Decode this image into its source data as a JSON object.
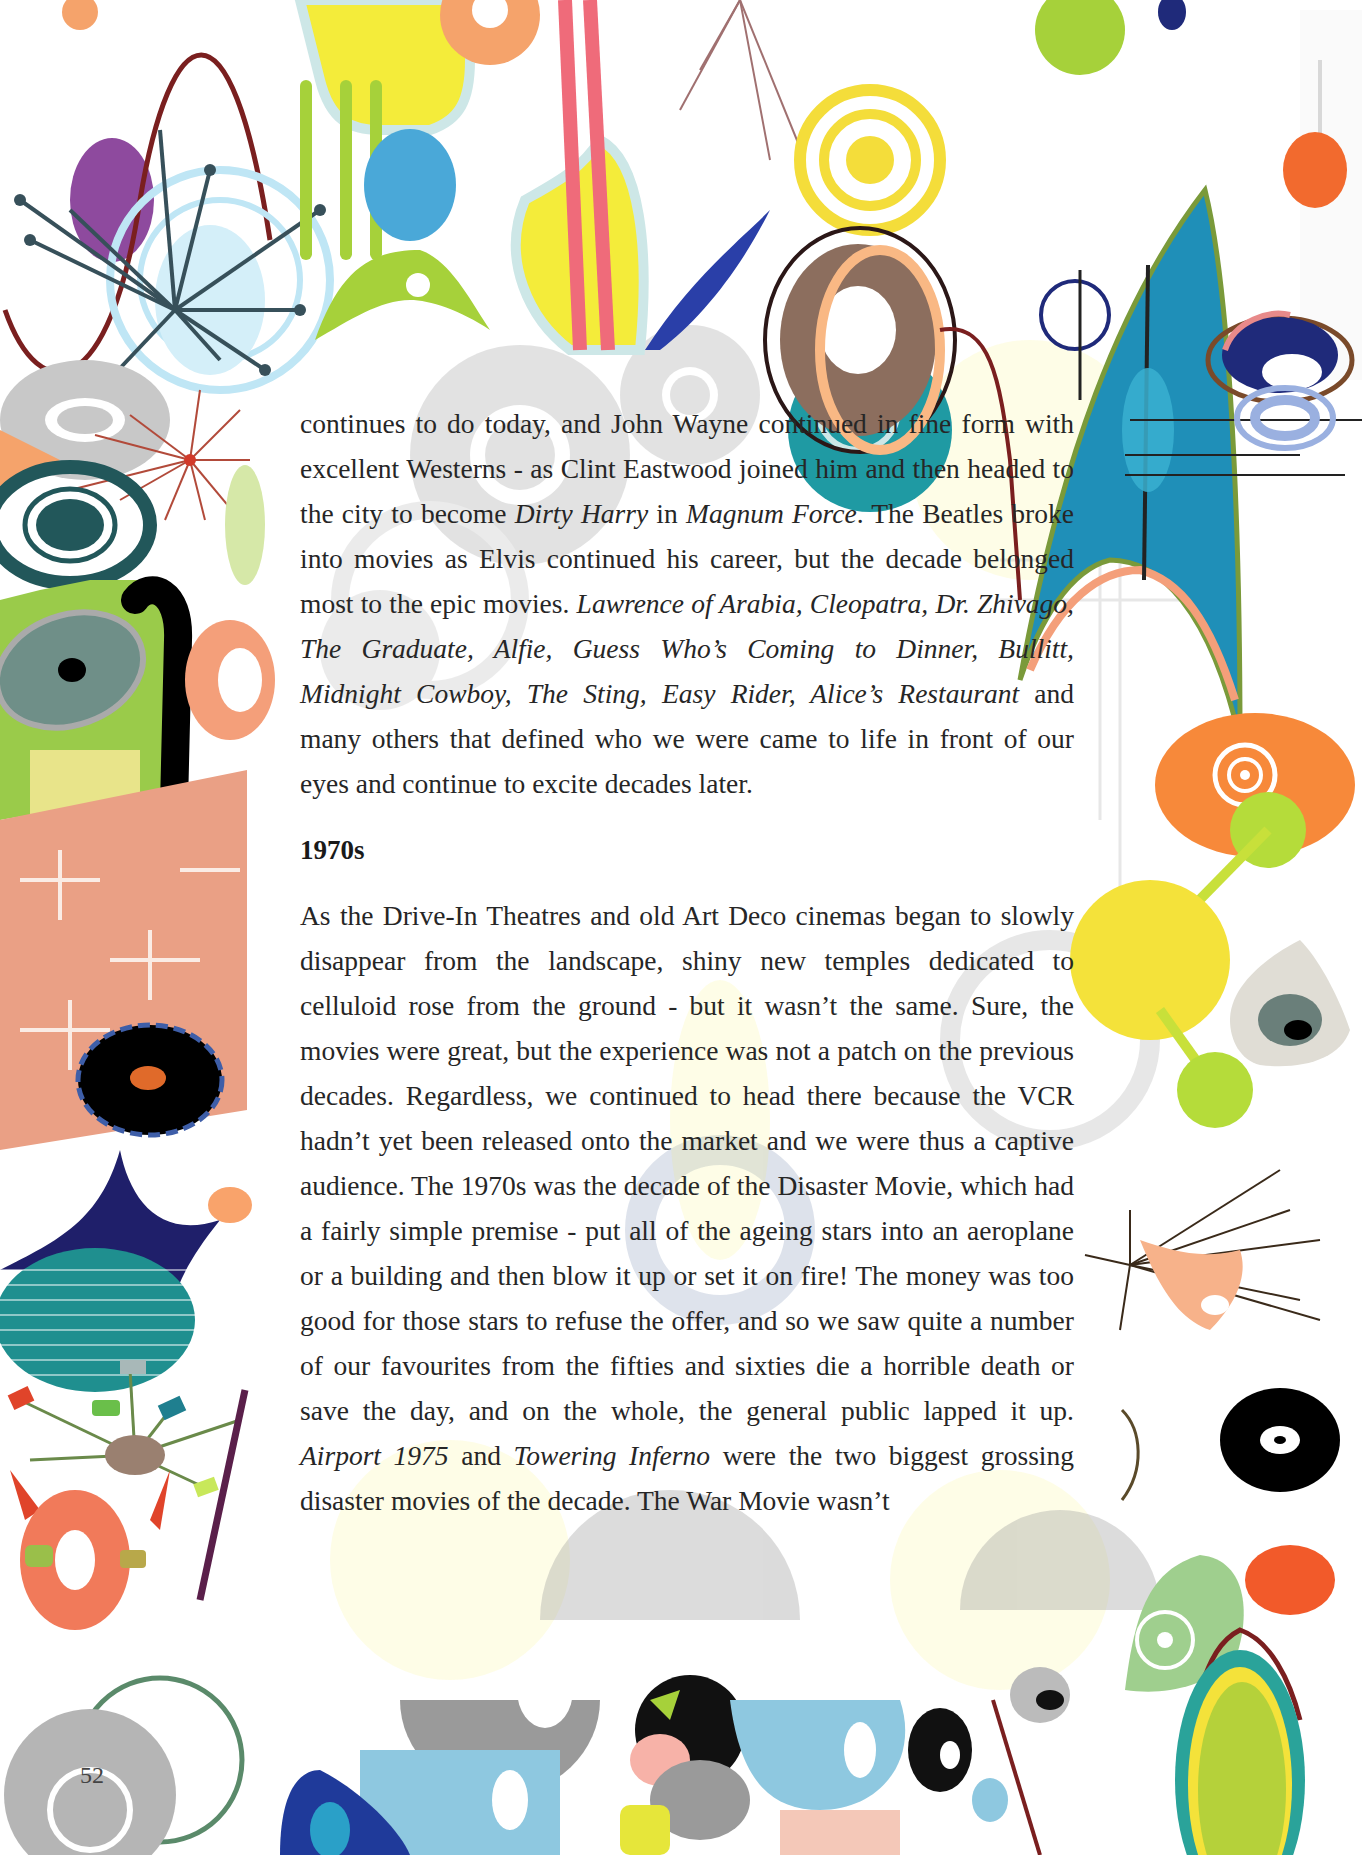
{
  "page": {
    "page_number": "52"
  },
  "paragraph_1": {
    "segments": [
      {
        "text": "continues to do today, and John Wayne continued in fine form with excellent Westerns - as Clint Eastwood joined him and then headed to the city to become ",
        "italic": false
      },
      {
        "text": "Dirty Harry",
        "italic": true
      },
      {
        "text": " in ",
        "italic": false
      },
      {
        "text": "Magnum Force",
        "italic": true
      },
      {
        "text": ". The Beatles broke into movies as Elvis continued his career, but the decade belonged most to the epic movies. ",
        "italic": false
      },
      {
        "text": "Lawrence of Arabia, Cleopatra, Dr. Zhivago, The Graduate, Alfie, Guess Who’s Coming to Dinner, Bullitt, Midnight Cowboy, The Sting, Easy Rider, Alice’s Restaurant",
        "italic": true
      },
      {
        "text": " and many others that defined who we were came to life in front of our eyes and continue to excite decades later.",
        "italic": false
      }
    ]
  },
  "section_heading": "1970s",
  "paragraph_2": {
    "segments": [
      {
        "text": "As the Drive-In Theatres and old Art Deco cinemas began to slowly disappear from the landscape, shiny new temples dedicated to celluloid rose from the ground - but it wasn’t the same. Sure, the movies were great, but the experience was not a patch on the previous decades. Regardless, we continued to head there because the VCR hadn’t yet been released onto the market and we were thus a captive audience. The 1970s was the decade of the Disaster Movie, which had a fairly simple premise - put all of the ageing stars into an aeroplane or a building and then blow it up or set it on fire! The money was too good for those stars to refuse the offer, and so we saw quite a number of our favourites from the fifties and sixties die a horrible death or save the day, and on the whole, the general public lapped it up. ",
        "italic": false
      },
      {
        "text": "Airport 1975",
        "italic": true
      },
      {
        "text": " and ",
        "italic": false
      },
      {
        "text": "Towering Inferno",
        "italic": true
      },
      {
        "text": " were the two biggest grossing disaster movies of the decade. The War Movie wasn’t",
        "italic": false
      }
    ]
  },
  "decorations": {
    "style": "retro atomic-age pattern border",
    "colors": [
      "#8e4a9e",
      "#4aa8d8",
      "#a6d13a",
      "#f4ec3a",
      "#ef6b7a",
      "#f5a36b",
      "#2a3fa8",
      "#1f9aa3",
      "#8c6e5e",
      "#f26a2e",
      "#1f2a7a",
      "#22575a",
      "#000000",
      "#9fcf8e",
      "#b5b5b5"
    ]
  }
}
